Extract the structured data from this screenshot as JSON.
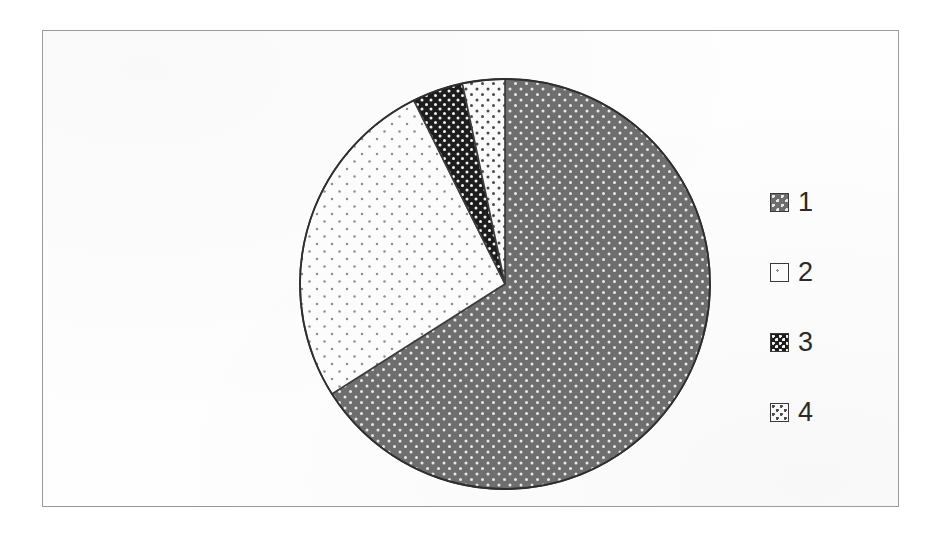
{
  "figure": {
    "background_color": "#ffffff",
    "frame_color": "#9b9b9b"
  },
  "legend": {
    "position": "right",
    "items": [
      {
        "label": "1",
        "swatch_name": "legend-swatch-series-1",
        "pattern": "dark-gray-with-light-dots",
        "fill": "#6e6e6e",
        "dot_color": "#e8e8e8"
      },
      {
        "label": "2",
        "swatch_name": "legend-swatch-series-2",
        "pattern": "white-with-sparse-gray-dots",
        "fill": "#fcfcfc",
        "dot_color": "#9a9a9a"
      },
      {
        "label": "3",
        "swatch_name": "legend-swatch-series-3",
        "pattern": "black-with-white-dots",
        "fill": "#1d1d1d",
        "dot_color": "#f2f2f2"
      },
      {
        "label": "4",
        "swatch_name": "legend-swatch-series-4",
        "pattern": "white-with-dark-dots",
        "fill": "#fafafa",
        "dot_color": "#555555"
      }
    ]
  },
  "chart_data": {
    "type": "pie",
    "title": "",
    "subtitle": "",
    "xlabel": "",
    "ylabel": "",
    "grid": false,
    "legend_position": "right",
    "start_angle_deg": 0,
    "direction": "clockwise",
    "categories": [
      "1",
      "2",
      "3",
      "4"
    ],
    "values": [
      66.0,
      26.7,
      4.0,
      3.3
    ],
    "value_unit": "percent",
    "slices": [
      {
        "label": "1",
        "value": 66.0,
        "start_angle_deg": 0.0,
        "end_angle_deg": 237.6,
        "sweep_deg": 237.6,
        "fill": "#6e6e6e",
        "dot_color": "#e8e8e8",
        "pattern": "dark-gray-with-light-dots"
      },
      {
        "label": "2",
        "value": 26.7,
        "start_angle_deg": 237.6,
        "end_angle_deg": 333.6,
        "sweep_deg": 96.0,
        "fill": "#fcfcfc",
        "dot_color": "#9a9a9a",
        "pattern": "white-with-sparse-gray-dots"
      },
      {
        "label": "3",
        "value": 4.0,
        "start_angle_deg": 333.6,
        "end_angle_deg": 348.0,
        "sweep_deg": 14.4,
        "fill": "#1d1d1d",
        "dot_color": "#f2f2f2",
        "pattern": "black-with-white-dots"
      },
      {
        "label": "4",
        "value": 3.3,
        "start_angle_deg": 348.0,
        "end_angle_deg": 360.0,
        "sweep_deg": 12.0,
        "fill": "#fafafa",
        "dot_color": "#555555",
        "pattern": "white-with-dark-dots"
      }
    ],
    "geometry": {
      "center_x": 462,
      "center_y": 253,
      "radius": 205
    }
  }
}
